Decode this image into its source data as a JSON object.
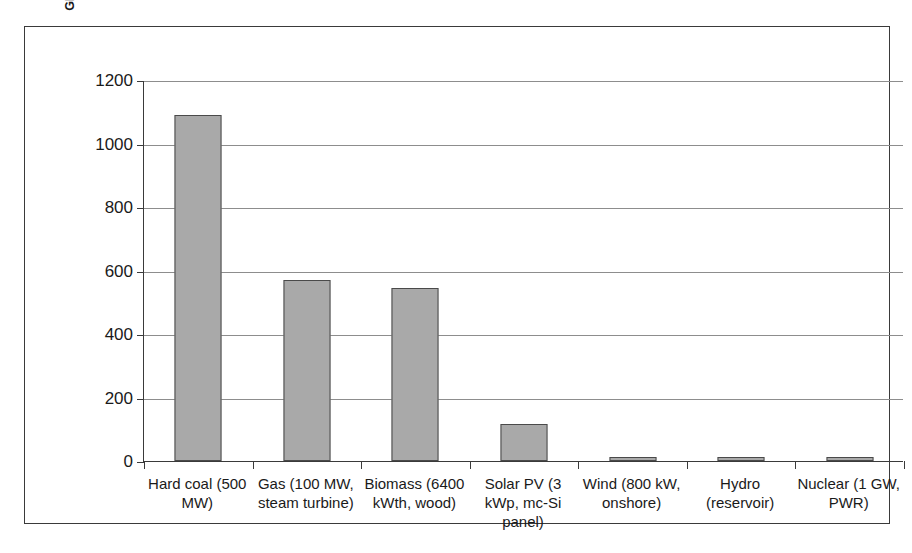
{
  "chart_data": {
    "type": "bar",
    "title": "",
    "xlabel": "",
    "ylabel": "Global Warming Potential (g CO2 eq./kWh)",
    "ylim": [
      0,
      1200
    ],
    "yticks": [
      0,
      200,
      400,
      600,
      800,
      1000,
      1200
    ],
    "ytick_labels": [
      "0",
      "200",
      "400",
      "600",
      "800",
      "1000",
      "1200"
    ],
    "grid": "horizontal",
    "legend": "none",
    "bar_color": "#a9a9a9",
    "bar_edge_color": "#4a4a4a",
    "categories": [
      "Hard coal (500 MW)",
      "Gas (100 MW, steam turbine)",
      "Biomass (6400 kWth, wood)",
      "Solar PV (3 kWp, mc-Si panel)",
      "Wind (800 kW, onshore)",
      "Hydro (reservoir)",
      "Nuclear (1 GW, PWR)"
    ],
    "category_lines": [
      [
        "Hard coal (500",
        "MW)"
      ],
      [
        "Gas (100 MW,",
        "steam turbine)"
      ],
      [
        "Biomass (6400",
        "kWth, wood)"
      ],
      [
        "Solar PV (3",
        "kWp, mc-Si",
        "panel)"
      ],
      [
        "Wind (800 kW,",
        "onshore)"
      ],
      [
        "Hydro",
        "(reservoir)"
      ],
      [
        "Nuclear (1 GW,",
        "PWR)"
      ]
    ],
    "values": [
      1090,
      570,
      545,
      117,
      14,
      13,
      12
    ]
  }
}
